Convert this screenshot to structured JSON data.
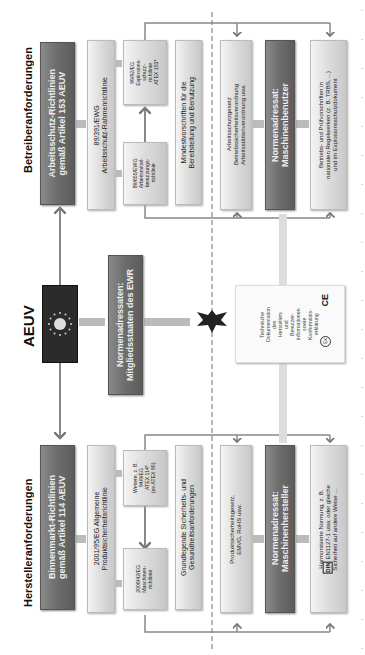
{
  "center": {
    "title": "AEUV",
    "flag_icon": "eu-flag-icon",
    "member_states_box": "Normenadressaten:\nMitgliedsstaaten des EWR",
    "eagle_icon": "german-eagle-icon",
    "tech_doc_box": "Technische\nDokumentation\ndes\nHerstellers\nund\nBenutzer-\ninformationen\nsowie\nKonformitäts-\nerklärung",
    "ce_mark": "CE",
    "ex_mark": "Ex"
  },
  "operator": {
    "title": "Betreiberanforderungen",
    "directive_box": "Arbeitsschutz-Richtlinien\ngemäß Artikel 153 AEUV",
    "framework_box": "89/391/EWG\nArbeitsschutz-Rahmenrichtlinie",
    "work_equipment_box": "89/655/EWG\nArbeitsmittel-\nbenutzungs-\nrichtlinie",
    "atex_box": "99/92/EG\nExplosions-\nschutz-\nrichtlinie\nATEX 153*",
    "min_req_box": "Mindestvorschriften für die\nBereitstellung und Benutzung",
    "law_box": "Arbeitsschutzgesetz\nBetriebssicherheitsverordnung\nArbeitsstättenverordnung usw.",
    "addressee_box": "Normenadressat:\nMaschinenbenutzer",
    "rules_box": "Betriebs- und Prüfvorschriften in\nnationalen Regelwerken (z. B. TRBS, ...)\nund im Explosionsschutzdokument"
  },
  "manufacturer": {
    "title": "Herstelleranforderungen",
    "directive_box": "Binnenmarkt-Richtlinien\ngemäß Artikel 114 AEUV",
    "product_safety_box": "2001/95/EG Allgemeine\nProduktsicherheitsrichtlinie",
    "machinery_box": "2006/42/EG\nMaschinen-\nrichtlinie",
    "other_box": "Weitere, z. B.\n94/9/EG\nATEX 114*\n(ex ATEX 95)",
    "essential_req_box": "Grundlegende Sicherheits- und\nGesundheitsanforderungen",
    "law_box": "Produktsicherheitsgesetz,\nEMVG, RoHS usw.",
    "addressee_box": "Normenadressat:\nMaschinenhersteller",
    "standards_prefix": "DIN",
    "standards_box_line1": "Harmonisierte Normung, z. B.",
    "standards_box_line2": " EN1127-1 usw. oder gleiche",
    "standards_box_line3": "Sicherheit auf andere Weise ..."
  }
}
